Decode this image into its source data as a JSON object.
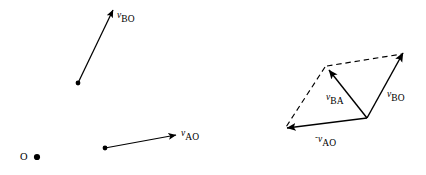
{
  "figure": {
    "background_color": "#ffffff",
    "stroke_color": "#000000",
    "width": 426,
    "height": 175
  },
  "left_diagram": {
    "name": "absolute-velocity-vectors",
    "pole": {
      "label": "O",
      "label_x": 20,
      "label_y": 152,
      "dot_x": 37,
      "dot_y": 157,
      "dot_radius": 3.1
    },
    "vectors": [
      {
        "id": "vbo",
        "symbol": "v",
        "subscript": "BO",
        "sign": "",
        "x1": 78,
        "y1": 83,
        "x2": 113,
        "y2": 10,
        "tail_dot": true,
        "style": "solid",
        "label_x": 117,
        "label_y": 7
      },
      {
        "id": "vao",
        "symbol": "v",
        "subscript": "AO",
        "sign": "",
        "x1": 105,
        "y1": 148,
        "x2": 176,
        "y2": 135,
        "tail_dot": true,
        "style": "solid",
        "label_x": 181,
        "label_y": 125
      }
    ]
  },
  "right_diagram": {
    "name": "relative-velocity-parallelogram",
    "origin": {
      "x": 367,
      "y": 118
    },
    "vectors": [
      {
        "id": "vbo2",
        "symbol": "v",
        "subscript": "BO",
        "sign": "",
        "x1": 367,
        "y1": 118,
        "x2": 403,
        "y2": 53,
        "tail_dot": false,
        "style": "solid",
        "label_x": 387,
        "label_y": 86
      },
      {
        "id": "vba",
        "symbol": "v",
        "subscript": "BA",
        "sign": "",
        "x1": 367,
        "y1": 118,
        "x2": 329,
        "y2": 70,
        "tail_dot": false,
        "style": "solid",
        "label_x": 326,
        "label_y": 89
      },
      {
        "id": "vao_neg",
        "symbol": "v",
        "subscript": "AO",
        "sign": "-",
        "x1": 367,
        "y1": 118,
        "x2": 287,
        "y2": 128,
        "tail_dot": false,
        "style": "solid",
        "label_x": 315,
        "label_y": 131
      }
    ],
    "construction_lines": [
      {
        "id": "dash-top",
        "x1": 327,
        "y1": 66,
        "x2": 402,
        "y2": 54,
        "style": "dashed"
      },
      {
        "id": "dash-left",
        "x1": 325,
        "y1": 67,
        "x2": 286,
        "y2": 127,
        "style": "dashed"
      }
    ]
  }
}
